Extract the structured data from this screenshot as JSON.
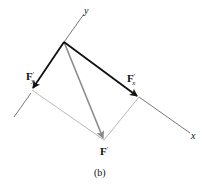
{
  "figure": {
    "caption": "(b)",
    "axes": {
      "x_label": "x",
      "y_label": "y"
    },
    "vectors": {
      "fx": {
        "label": "F",
        "prime": "′",
        "subscript": "x",
        "color": "#111111"
      },
      "fy": {
        "label": "F",
        "prime": "′",
        "subscript": "y",
        "color": "#111111"
      },
      "resultant": {
        "label": "F",
        "prime": "′",
        "color": "#8a8a8a"
      }
    },
    "colors": {
      "axis": "#555555",
      "construction": "#9a9a9a"
    }
  }
}
